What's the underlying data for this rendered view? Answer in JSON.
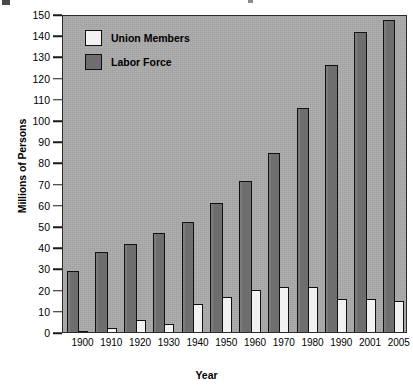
{
  "chart_data": {
    "type": "bar",
    "title": "",
    "xlabel": "Year",
    "ylabel": "Millions of Persons",
    "categories": [
      "1900",
      "1910",
      "1920",
      "1930",
      "1940",
      "1950",
      "1960",
      "1970",
      "1980",
      "1990",
      "2001",
      "2005"
    ],
    "series": [
      {
        "name": "Union Members",
        "color": "#f2f2f2",
        "values": [
          1.6,
          2.8,
          6.8,
          4.8,
          14.3,
          17.4,
          20.9,
          22.2,
          22.4,
          16.7,
          16.3,
          15.7
        ]
      },
      {
        "name": "Labor Force",
        "color": "#6e6e6e",
        "values": [
          29.5,
          38.8,
          42.4,
          47.8,
          52.8,
          61.9,
          72.1,
          85.2,
          106.4,
          126.9,
          142.5,
          148.0
        ]
      }
    ],
    "ylim": [
      0,
      150
    ],
    "ytick_step": 10,
    "yticks": [
      "0",
      "10",
      "20",
      "30",
      "40",
      "50",
      "60",
      "70",
      "80",
      "90",
      "100",
      "110",
      "120",
      "130",
      "140",
      "150"
    ],
    "grid": false,
    "legend_position": "top-left",
    "plot_background": "#a9a9a9",
    "axis_color": "#1a1a1a"
  },
  "legend": {
    "items": [
      {
        "label": "Union Members",
        "swatch": "#f2f2f2"
      },
      {
        "label": "Labor Force",
        "swatch": "#6e6e6e"
      }
    ]
  },
  "axes": {
    "y_title": "Millions of Persons",
    "x_title": "Year"
  }
}
